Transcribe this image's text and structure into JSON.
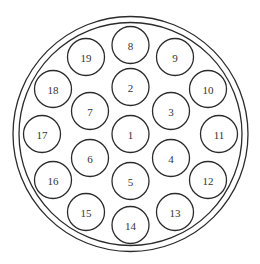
{
  "diagram": {
    "type": "circular-connector-pin-layout",
    "canvas": {
      "width": 260,
      "height": 264
    },
    "outer_ring": {
      "cx": 130.5,
      "cy": 134,
      "outer_radius": 117.5,
      "inner_radius": 111.5,
      "stroke_color": "#2b2b2b"
    },
    "pin_radius": 18.5,
    "pins": [
      {
        "label": "1",
        "cx": 130.5,
        "cy": 134
      },
      {
        "label": "2",
        "cx": 130.5,
        "cy": 87
      },
      {
        "label": "3",
        "cx": 171,
        "cy": 111
      },
      {
        "label": "4",
        "cx": 171,
        "cy": 158
      },
      {
        "label": "5",
        "cx": 130.5,
        "cy": 181
      },
      {
        "label": "6",
        "cx": 90,
        "cy": 158
      },
      {
        "label": "7",
        "cx": 90,
        "cy": 111
      },
      {
        "label": "8",
        "cx": 130.5,
        "cy": 45
      },
      {
        "label": "9",
        "cx": 175,
        "cy": 57
      },
      {
        "label": "10",
        "cx": 208,
        "cy": 89
      },
      {
        "label": "11",
        "cx": 219,
        "cy": 134
      },
      {
        "label": "12",
        "cx": 208,
        "cy": 180
      },
      {
        "label": "13",
        "cx": 175,
        "cy": 212
      },
      {
        "label": "14",
        "cx": 130.5,
        "cy": 225
      },
      {
        "label": "15",
        "cx": 86,
        "cy": 212
      },
      {
        "label": "16",
        "cx": 53,
        "cy": 180
      },
      {
        "label": "17",
        "cx": 42,
        "cy": 134
      },
      {
        "label": "18",
        "cx": 53,
        "cy": 89
      },
      {
        "label": "19",
        "cx": 86,
        "cy": 57
      }
    ]
  }
}
